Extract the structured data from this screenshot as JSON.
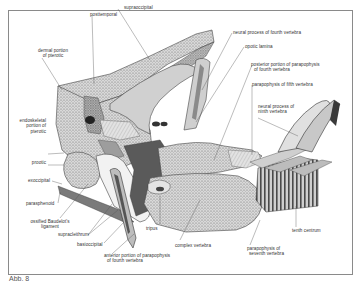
{
  "figure": {
    "caption": "Abb. 8",
    "colors": {
      "ink": "#333333",
      "frame": "#8a8a8a",
      "bone_light": "#e6e6e6",
      "bone_mid": "#bdbdbd",
      "bone_dark": "#6e6e6e"
    }
  },
  "labels": {
    "supraoccipital": "supraoccipital",
    "posttemporal": "posttemporal",
    "dermal_pterotic_1": "dermal portion",
    "dermal_pterotic_2": "of pterotic",
    "neural_process_4": "neural process of fourth vertebra",
    "opotic_lamina": "opotic lamina",
    "post_parapophysis_1": "posterior portion of parapophysis",
    "post_parapophysis_2": "of fourth vertebra",
    "parapophysis_5": "parapophysis of fifth vertebra",
    "neural_process_9_1": "neural process of",
    "neural_process_9_2": "ninth vertebra",
    "endoskeletal_1": "endoskeletal",
    "endoskeletal_2": "portion of",
    "endoskeletal_3": "pterotic",
    "prootic": "prootic",
    "exoccipital": "exoccipital",
    "parasphenoid": "parasphenoid",
    "ligament_1": "ossified Baudelot's",
    "ligament_2": "ligament",
    "supracleithrum": "supracleithrum",
    "basioccipital": "basioccipital",
    "ant_parapophysis_1": "anterior portion of parapophysis",
    "ant_parapophysis_2": "of fourth vertebra",
    "tripus": "tripus",
    "complex_vertebra": "complex vertebra",
    "parapophysis_7_1": "parapophysis of",
    "parapophysis_7_2": "seventh vertebra",
    "tenth_centrum": "tenth centrum"
  }
}
